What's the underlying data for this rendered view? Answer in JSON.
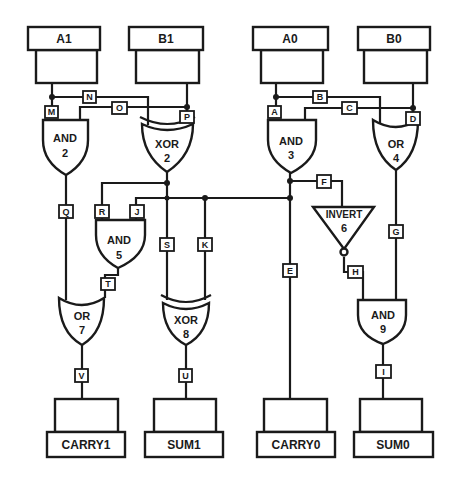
{
  "diagram": {
    "inputs": [
      {
        "id": "A1",
        "label": "A1"
      },
      {
        "id": "B1",
        "label": "B1"
      },
      {
        "id": "A0",
        "label": "A0"
      },
      {
        "id": "B0",
        "label": "B0"
      }
    ],
    "outputs": [
      {
        "id": "CARRY1",
        "label": "CARRY1"
      },
      {
        "id": "SUM1",
        "label": "SUM1"
      },
      {
        "id": "CARRY0",
        "label": "CARRY0"
      },
      {
        "id": "SUM0",
        "label": "SUM0"
      }
    ],
    "gates": [
      {
        "id": "1",
        "type": "AND",
        "type_label": "AND",
        "number": "1"
      },
      {
        "id": "2",
        "type": "XOR",
        "type_label": "XOR",
        "number": "2"
      },
      {
        "id": "3",
        "type": "AND",
        "type_label": "AND",
        "number": "3"
      },
      {
        "id": "4",
        "type": "OR",
        "type_label": "OR",
        "number": "4"
      },
      {
        "id": "5",
        "type": "AND",
        "type_label": "AND",
        "number": "5"
      },
      {
        "id": "6",
        "type": "INVERT",
        "type_label": "INVERT",
        "number": "6"
      },
      {
        "id": "7",
        "type": "OR",
        "type_label": "OR",
        "number": "7"
      },
      {
        "id": "8",
        "type": "XOR",
        "type_label": "XOR",
        "number": "8"
      },
      {
        "id": "9",
        "type": "AND",
        "type_label": "AND",
        "number": "9"
      }
    ],
    "wires": {
      "A": "A",
      "B": "B",
      "C": "C",
      "D": "D",
      "E": "E",
      "F": "F",
      "G": "G",
      "H": "H",
      "I": "I",
      "J": "J",
      "K": "K",
      "M": "M",
      "N": "N",
      "O": "O",
      "P": "P",
      "Q": "Q",
      "R": "R",
      "S": "S",
      "T": "T",
      "U": "U",
      "V": "V"
    },
    "connections": [
      {
        "wire": "M",
        "from": "A1",
        "to": "gate 1"
      },
      {
        "wire": "N",
        "from": "A1",
        "to": "gate 2"
      },
      {
        "wire": "O",
        "from": "B1",
        "to": "gate 1"
      },
      {
        "wire": "P",
        "from": "B1",
        "to": "gate 2"
      },
      {
        "wire": "A",
        "from": "A0",
        "to": "gate 3"
      },
      {
        "wire": "B",
        "from": "A0",
        "to": "gate 4"
      },
      {
        "wire": "C",
        "from": "B0",
        "to": "gate 3"
      },
      {
        "wire": "D",
        "from": "B0",
        "to": "gate 4"
      },
      {
        "wire": "Q",
        "from": "gate 1",
        "to": "gate 7"
      },
      {
        "wire": "R",
        "from": "gate 2",
        "to": "gate 5"
      },
      {
        "wire": "S",
        "from": "gate 2",
        "to": "gate 8"
      },
      {
        "wire": "J",
        "from": "gate 3",
        "to": "gate 5"
      },
      {
        "wire": "K",
        "from": "gate 3",
        "to": "gate 8"
      },
      {
        "wire": "E",
        "from": "gate 3",
        "to": "CARRY0"
      },
      {
        "wire": "F",
        "from": "gate 3",
        "to": "gate 6"
      },
      {
        "wire": "G",
        "from": "gate 4",
        "to": "gate 9"
      },
      {
        "wire": "H",
        "from": "gate 6",
        "to": "gate 9"
      },
      {
        "wire": "T",
        "from": "gate 5",
        "to": "gate 7"
      },
      {
        "wire": "V",
        "from": "gate 7",
        "to": "CARRY1"
      },
      {
        "wire": "U",
        "from": "gate 8",
        "to": "SUM1"
      },
      {
        "wire": "I",
        "from": "gate 9",
        "to": "SUM0"
      }
    ]
  }
}
